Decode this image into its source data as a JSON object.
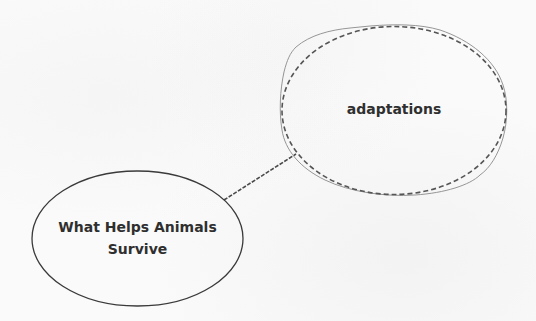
{
  "diagram": {
    "type": "concept-map",
    "nodes": [
      {
        "id": "root",
        "label_line1": "What Helps Animals",
        "label_line2": "Survive",
        "shape": "ellipse",
        "border": "solid",
        "selected": false
      },
      {
        "id": "adaptations",
        "label": "adaptations",
        "shape": "ellipse",
        "border": "dashed",
        "selected": true
      }
    ],
    "edges": [
      {
        "from": "root",
        "to": "adaptations",
        "style": "dashed"
      }
    ]
  },
  "colors": {
    "background": "#fafafa",
    "text": "#2f2f2f",
    "outline": "#3a3a3a",
    "dashed_outline": "#555555",
    "selection_outline": "#8a8a8a"
  }
}
